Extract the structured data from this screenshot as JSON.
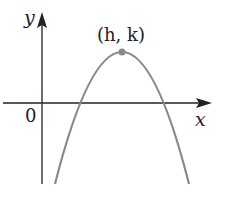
{
  "diagram": {
    "type": "parabola-graph",
    "axes": {
      "x_label": "x",
      "y_label": "y",
      "origin_label": "0"
    },
    "vertex": {
      "label": "(h, k)",
      "h": "h",
      "k": "k"
    },
    "curve": {
      "shape": "downward-opening parabola",
      "color": "#8a8a8a"
    },
    "colors": {
      "axes": "#222222",
      "curve": "#8a8a8a",
      "vertex_point": "#8a8a8a"
    }
  }
}
